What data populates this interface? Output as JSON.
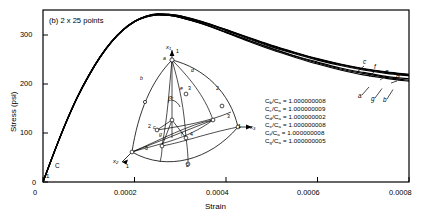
{
  "figure": {
    "panel_label": "(b) 2 x 25 points",
    "xlabel": "Strain",
    "ylabel": "Stress (psi)"
  },
  "chart_data": {
    "type": "line",
    "title": "(b) 2 x 25 points",
    "xlabel": "Strain",
    "ylabel": "Stress (psi)",
    "xlim": [
      0,
      0.0008
    ],
    "ylim": [
      0,
      350
    ],
    "xticks": [
      "0",
      "0.0002",
      "0.0004",
      "0.0006",
      "0.0008"
    ],
    "xtick_values": [
      0,
      0.0002,
      0.0004,
      0.0006,
      0.0008
    ],
    "yticks": [
      "0",
      "100",
      "200",
      "300"
    ],
    "ytick_values": [
      0,
      100,
      200,
      300
    ],
    "grid": false,
    "legend_position": "inside-right",
    "origin_labels": [
      "C",
      "1"
    ],
    "series": [
      {
        "name": "a",
        "end_label": "a",
        "x": [
          0,
          2.5e-05,
          5e-05,
          7.5e-05,
          0.0001,
          0.000125,
          0.00015,
          0.000175,
          0.0002,
          0.000225,
          0.00025,
          0.000275,
          0.0003,
          0.00035,
          0.0004,
          0.00045,
          0.0005,
          0.00055,
          0.0006,
          0.00065,
          0.0007,
          0.00075,
          0.0008
        ],
        "y": [
          0,
          62,
          120,
          172,
          216,
          254,
          285,
          309,
          326,
          336,
          340,
          339,
          335,
          322,
          305,
          288,
          271,
          256,
          242,
          230,
          221,
          213,
          207
        ]
      },
      {
        "name": "b",
        "end_label": "b",
        "x": [
          0,
          2.5e-05,
          5e-05,
          7.5e-05,
          0.0001,
          0.000125,
          0.00015,
          0.000175,
          0.0002,
          0.000225,
          0.00025,
          0.000275,
          0.0003,
          0.00035,
          0.0004,
          0.00045,
          0.0005,
          0.00055,
          0.0006,
          0.00065,
          0.0007,
          0.00075,
          0.0008
        ],
        "y": [
          0,
          62,
          120,
          172,
          216,
          254,
          285,
          309,
          326,
          336,
          340,
          339,
          335,
          321,
          304,
          286,
          269,
          254,
          240,
          228,
          218,
          211,
          205
        ]
      },
      {
        "name": "c",
        "end_label": "c",
        "x": [
          0,
          2.5e-05,
          5e-05,
          7.5e-05,
          0.0001,
          0.000125,
          0.00015,
          0.000175,
          0.0002,
          0.000225,
          0.00025,
          0.000275,
          0.0003,
          0.00035,
          0.0004,
          0.00045,
          0.0005,
          0.00055,
          0.0006,
          0.00065,
          0.0007,
          0.00075,
          0.0008
        ],
        "y": [
          0,
          62,
          121,
          173,
          217,
          255,
          286,
          310,
          327,
          337,
          342,
          341,
          338,
          326,
          310,
          294,
          278,
          264,
          251,
          240,
          231,
          224,
          219
        ]
      },
      {
        "name": "d",
        "end_label": "d",
        "x": [
          0,
          2.5e-05,
          5e-05,
          7.5e-05,
          0.0001,
          0.000125,
          0.00015,
          0.000175,
          0.0002,
          0.000225,
          0.00025,
          0.000275,
          0.0003,
          0.00035,
          0.0004,
          0.00045,
          0.0005,
          0.00055,
          0.0006,
          0.00065,
          0.0007,
          0.00075,
          0.0008
        ],
        "y": [
          0,
          62,
          120,
          172,
          216,
          254,
          285,
          309,
          326,
          337,
          341,
          340,
          336,
          324,
          308,
          291,
          275,
          261,
          248,
          237,
          228,
          221,
          216
        ]
      },
      {
        "name": "e",
        "end_label": "e",
        "x": [
          0,
          2.5e-05,
          5e-05,
          7.5e-05,
          0.0001,
          0.000125,
          0.00015,
          0.000175,
          0.0002,
          0.000225,
          0.00025,
          0.000275,
          0.0003,
          0.00035,
          0.0004,
          0.00045,
          0.0005,
          0.00055,
          0.0006,
          0.00065,
          0.0007,
          0.00075,
          0.0008
        ],
        "y": [
          0,
          62,
          121,
          173,
          217,
          255,
          286,
          310,
          327,
          337,
          341,
          341,
          337,
          325,
          309,
          293,
          277,
          263,
          250,
          239,
          230,
          223,
          217
        ]
      },
      {
        "name": "f",
        "end_label": "f",
        "x": [
          0,
          2.5e-05,
          5e-05,
          7.5e-05,
          0.0001,
          0.000125,
          0.00015,
          0.000175,
          0.0002,
          0.000225,
          0.00025,
          0.000275,
          0.0003,
          0.00035,
          0.0004,
          0.00045,
          0.0005,
          0.00055,
          0.0006,
          0.00065,
          0.0007,
          0.00075,
          0.0008
        ],
        "y": [
          0,
          62,
          121,
          173,
          217,
          255,
          286,
          310,
          327,
          337,
          342,
          341,
          338,
          325,
          310,
          293,
          277,
          263,
          250,
          239,
          230,
          223,
          218
        ]
      },
      {
        "name": "g",
        "end_label": "g",
        "x": [
          0,
          2.5e-05,
          5e-05,
          7.5e-05,
          0.0001,
          0.000125,
          0.00015,
          0.000175,
          0.0002,
          0.000225,
          0.00025,
          0.000275,
          0.0003,
          0.00035,
          0.0004,
          0.00045,
          0.0005,
          0.00055,
          0.0006,
          0.00065,
          0.0007,
          0.00075,
          0.0008
        ],
        "y": [
          0,
          62,
          120,
          172,
          216,
          254,
          285,
          309,
          326,
          336,
          340,
          339,
          335,
          322,
          305,
          288,
          272,
          257,
          244,
          232,
          223,
          215,
          210
        ]
      }
    ],
    "annotations": [
      {
        "text": "c",
        "x": 0.000695,
        "y": 285
      },
      {
        "text": "f",
        "x": 0.000722,
        "y": 272
      },
      {
        "text": "e",
        "x": 0.000748,
        "y": 258
      },
      {
        "text": "d",
        "x": 0.000775,
        "y": 243
      },
      {
        "text": "a",
        "x": 0.00069,
        "y": 183
      },
      {
        "text": "g",
        "x": 0.000722,
        "y": 170
      },
      {
        "text": "b",
        "x": 0.000752,
        "y": 160
      }
    ]
  },
  "legend": {
    "rows": [
      {
        "num_sub": "b",
        "den_sub": "a",
        "label_num": "C",
        "label_den": "C",
        "eq": "=",
        "value": "1.000000008"
      },
      {
        "num_sub": "c",
        "den_sub": "a",
        "label_num": "C",
        "label_den": "C",
        "eq": "=",
        "value": "1.000000009"
      },
      {
        "num_sub": "d",
        "den_sub": "a",
        "label_num": "C",
        "label_den": "C",
        "eq": "=",
        "value": "1.000000002"
      },
      {
        "num_sub": "e",
        "den_sub": "a",
        "label_num": "C",
        "label_den": "C",
        "eq": "=",
        "value": "1.000000008"
      },
      {
        "num_sub": "f",
        "den_sub": "a",
        "label_num": "C",
        "label_den": "C",
        "eq": "=",
        "value": "1.000000008"
      },
      {
        "num_sub": "g",
        "den_sub": "a",
        "label_num": "C",
        "label_den": "C",
        "eq": "=",
        "value": "1.000000005"
      }
    ]
  },
  "inset": {
    "axis_x1": "x",
    "axis_x1_sub": "1",
    "axis_x2": "x",
    "axis_x2_sub": "2",
    "axis_x3": "x",
    "axis_x3_sub": "3",
    "angle_label": "β",
    "point_labels": [
      "a",
      "b",
      "c",
      "d",
      "e",
      "f",
      "g"
    ],
    "numbers": [
      "1",
      "2",
      "3",
      "4",
      "5"
    ]
  },
  "colors": {
    "curve": "#000000",
    "axis": "#000000",
    "background": "#ffffff"
  }
}
